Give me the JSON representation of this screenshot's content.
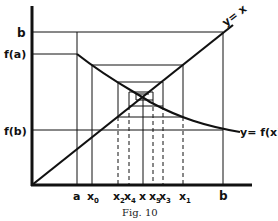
{
  "figure": {
    "caption": "Fig. 10",
    "ink_color": "#111111",
    "background": "#ffffff"
  },
  "axes": {
    "origin_px": [
      32,
      185
    ],
    "y_axis_top_px": 6,
    "x_axis_right_px": 252
  },
  "y_labels": [
    {
      "id": "b",
      "text": "b",
      "y": 32
    },
    {
      "id": "fa",
      "text": "f(a)",
      "y": 54
    },
    {
      "id": "fb",
      "text": "f(b)",
      "y": 130
    }
  ],
  "x_labels": [
    {
      "id": "a",
      "text": "a",
      "x": 77,
      "sub": ""
    },
    {
      "id": "x0",
      "text": "x",
      "x": 92,
      "sub": "0"
    },
    {
      "id": "x2",
      "text": "x",
      "x": 118,
      "sub": "2"
    },
    {
      "id": "x4",
      "text": "x",
      "x": 129,
      "sub": "4"
    },
    {
      "id": "xstar",
      "text": "x",
      "x": 143,
      "sub": ""
    },
    {
      "id": "x5",
      "text": "x",
      "x": 153,
      "sub": "5"
    },
    {
      "id": "x3",
      "text": "x",
      "x": 163,
      "sub": "3"
    },
    {
      "id": "x1",
      "text": "x",
      "x": 183,
      "sub": "1"
    },
    {
      "id": "b",
      "text": "b",
      "x": 223,
      "sub": ""
    }
  ],
  "curves": {
    "identity_label": "y= x",
    "function_label": "y= f(x)"
  },
  "cobweb": {
    "levels": [
      {
        "x_left": 92,
        "x_right": 183,
        "y_top": 65,
        "y_bottom": 117
      },
      {
        "x_left": 118,
        "x_right": 163,
        "y_top": 82,
        "y_bottom": 106
      },
      {
        "x_left": 129,
        "x_right": 153,
        "y_top": 92,
        "y_bottom": 100
      }
    ],
    "fixed_point_px": [
      143,
      96
    ]
  }
}
